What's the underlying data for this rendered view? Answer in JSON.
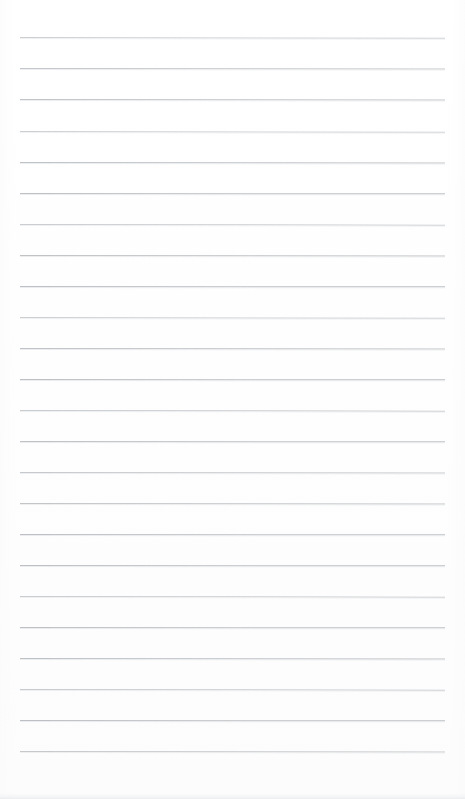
{
  "document": {
    "kind": "lined-paper-scan",
    "page_width": 465,
    "page_height": 799,
    "background_color": "#ffffff",
    "has_vertical_margin_rule": false,
    "has_handwriting": false,
    "has_text": false,
    "has_header": false,
    "has_page_number": false
  },
  "ruling": {
    "line_color": "#b9bdc1",
    "line_color_light": "#d2d5d8",
    "line_thickness_px": 1,
    "line_start_x": 20,
    "line_end_x": 445,
    "first_line_y": 37,
    "line_spacing_px": 31.05,
    "line_count": 24,
    "top_margin_px": 37,
    "bottom_margin_px": 49,
    "left_margin_px": 20,
    "right_margin_px": 20
  },
  "lines": [
    {
      "index": 1,
      "y": 37,
      "opacity": 0.72,
      "tilt_deg": 0.1
    },
    {
      "index": 2,
      "y": 68,
      "opacity": 0.85,
      "tilt_deg": 0.08
    },
    {
      "index": 3,
      "y": 99,
      "opacity": 0.88,
      "tilt_deg": 0.06
    },
    {
      "index": 4,
      "y": 131,
      "opacity": 0.7,
      "tilt_deg": 0.1
    },
    {
      "index": 5,
      "y": 162,
      "opacity": 0.9,
      "tilt_deg": 0.06
    },
    {
      "index": 6,
      "y": 193,
      "opacity": 0.92,
      "tilt_deg": 0.05
    },
    {
      "index": 7,
      "y": 224,
      "opacity": 0.74,
      "tilt_deg": 0.09
    },
    {
      "index": 8,
      "y": 255,
      "opacity": 0.9,
      "tilt_deg": 0.06
    },
    {
      "index": 9,
      "y": 286,
      "opacity": 0.93,
      "tilt_deg": 0.05
    },
    {
      "index": 10,
      "y": 317,
      "opacity": 0.72,
      "tilt_deg": 0.1
    },
    {
      "index": 11,
      "y": 348,
      "opacity": 0.91,
      "tilt_deg": 0.06
    },
    {
      "index": 12,
      "y": 379,
      "opacity": 0.93,
      "tilt_deg": 0.05
    },
    {
      "index": 13,
      "y": 410,
      "opacity": 0.76,
      "tilt_deg": 0.09
    },
    {
      "index": 14,
      "y": 441,
      "opacity": 0.92,
      "tilt_deg": 0.05
    },
    {
      "index": 15,
      "y": 472,
      "opacity": 0.8,
      "tilt_deg": 0.08
    },
    {
      "index": 16,
      "y": 503,
      "opacity": 0.86,
      "tilt_deg": 0.07
    },
    {
      "index": 17,
      "y": 534,
      "opacity": 0.93,
      "tilt_deg": 0.05
    },
    {
      "index": 18,
      "y": 565,
      "opacity": 0.94,
      "tilt_deg": 0.05
    },
    {
      "index": 19,
      "y": 596,
      "opacity": 0.74,
      "tilt_deg": 0.09
    },
    {
      "index": 20,
      "y": 627,
      "opacity": 0.93,
      "tilt_deg": 0.05
    },
    {
      "index": 21,
      "y": 658,
      "opacity": 0.92,
      "tilt_deg": 0.06
    },
    {
      "index": 22,
      "y": 689,
      "opacity": 0.76,
      "tilt_deg": 0.09
    },
    {
      "index": 23,
      "y": 720,
      "opacity": 0.94,
      "tilt_deg": 0.05
    },
    {
      "index": 24,
      "y": 751,
      "opacity": 0.8,
      "tilt_deg": 0.08
    }
  ],
  "artifacts": {
    "bottom_edge_shadow": true,
    "bottom_edge_shadow_y": 793,
    "edge_vignette": true
  }
}
